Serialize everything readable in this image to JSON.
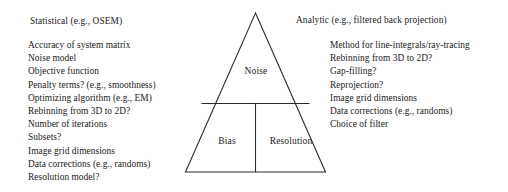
{
  "figure": {
    "stroke_color": "#2b2b2b",
    "background_color": "#ffffff"
  },
  "triangle": {
    "apex_label": "Noise",
    "bottom_left_label": "Bias",
    "bottom_right_label": "Resolution",
    "zones": [
      {
        "name": "noise",
        "label": "Noise"
      },
      {
        "name": "bias",
        "label": "Bias"
      },
      {
        "name": "resolution",
        "label": "Resolution"
      }
    ]
  },
  "left_panel": {
    "heading": "Statistical (e.g., OSEM)",
    "items": [
      "Accuracy of system matrix",
      "Noise model",
      "Objective function",
      "Penalty terms? (e.g., smoothness)",
      "Optimizing algorithm (e.g., EM)",
      "Rebinning from 3D to 2D?",
      "Number of iterations",
      "Subsets?",
      "Image grid dimensions",
      "Data corrections (e.g., randoms)",
      "Resolution model?"
    ]
  },
  "right_panel": {
    "heading": "Analytic (e.g., filtered back projection)",
    "items": [
      "Method for line-integrals/ray-tracing",
      "Rebinning from 3D to 2D?",
      "Gap-filling?",
      "Reprojection?",
      "Image grid dimensions",
      "Data corrections (e.g., randoms)",
      "Choice of filter"
    ]
  }
}
